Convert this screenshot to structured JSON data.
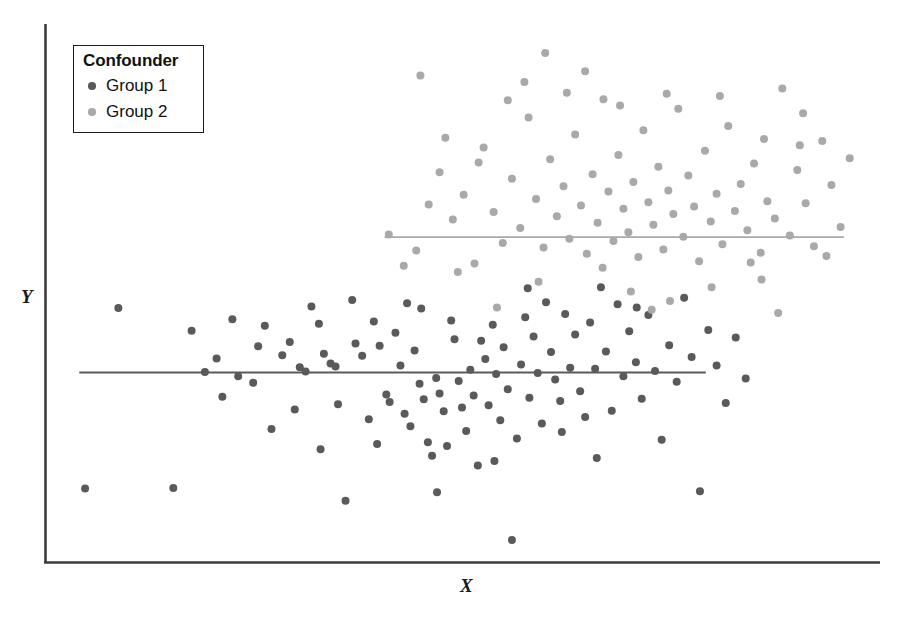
{
  "chart_data": {
    "type": "scatter",
    "title": "",
    "xlabel": "X",
    "ylabel": "Y",
    "grid": false,
    "axis_ticks": false,
    "axis_spines": [
      "left",
      "bottom"
    ],
    "legend": {
      "title": "Confounder",
      "position": "top-left",
      "frame": true,
      "entries": [
        {
          "label": "Group 1",
          "color": "#5a5a5a"
        },
        {
          "label": "Group 2",
          "color": "#a9a9a9"
        }
      ]
    },
    "xlim": [
      0,
      100
    ],
    "ylim": [
      0,
      100
    ],
    "annotation": "Two confounder groups; within each group the regression slope of Y on X is flat, while the pooled data appear positively associated.",
    "series": [
      {
        "name": "Group 1",
        "color": "#5a5a5a",
        "marker": "circle",
        "marker_size": 7,
        "fit_line": {
          "color": "#5a5a5a",
          "x_start": 4.0,
          "x_end": 79.3,
          "y_start": 35.1,
          "y_end": 35.1,
          "slope": 0.0
        },
        "points": [
          [
            4.7,
            13.5
          ],
          [
            15.3,
            13.6
          ],
          [
            8.7,
            47.1
          ],
          [
            17.5,
            42.9
          ],
          [
            20.5,
            37.7
          ],
          [
            22.4,
            45.0
          ],
          [
            23.1,
            34.4
          ],
          [
            24.9,
            33.2
          ],
          [
            26.3,
            43.8
          ],
          [
            27.1,
            24.6
          ],
          [
            28.4,
            38.3
          ],
          [
            29.3,
            40.8
          ],
          [
            30.5,
            36.1
          ],
          [
            31.2,
            35.3
          ],
          [
            31.9,
            47.4
          ],
          [
            32.8,
            44.2
          ],
          [
            33.4,
            38.6
          ],
          [
            34.2,
            36.8
          ],
          [
            34.8,
            36.2
          ],
          [
            35.1,
            29.2
          ],
          [
            36.0,
            11.2
          ],
          [
            37.2,
            40.5
          ],
          [
            38.0,
            38.2
          ],
          [
            38.8,
            26.4
          ],
          [
            39.4,
            44.6
          ],
          [
            40.1,
            40.1
          ],
          [
            40.9,
            31.0
          ],
          [
            41.3,
            29.6
          ],
          [
            42.0,
            42.5
          ],
          [
            42.6,
            36.4
          ],
          [
            43.1,
            27.4
          ],
          [
            43.8,
            25.1
          ],
          [
            44.3,
            39.2
          ],
          [
            44.9,
            33.0
          ],
          [
            45.4,
            30.1
          ],
          [
            45.9,
            22.1
          ],
          [
            46.4,
            19.6
          ],
          [
            46.9,
            34.1
          ],
          [
            47.3,
            31.2
          ],
          [
            47.8,
            27.9
          ],
          [
            48.2,
            21.4
          ],
          [
            48.7,
            44.8
          ],
          [
            49.1,
            41.3
          ],
          [
            49.6,
            33.5
          ],
          [
            50.0,
            28.6
          ],
          [
            50.5,
            24.2
          ],
          [
            51.0,
            35.6
          ],
          [
            51.4,
            30.8
          ],
          [
            51.9,
            17.8
          ],
          [
            52.3,
            41.0
          ],
          [
            52.8,
            37.6
          ],
          [
            53.2,
            29.0
          ],
          [
            53.7,
            44.0
          ],
          [
            54.1,
            34.8
          ],
          [
            54.6,
            26.2
          ],
          [
            55.0,
            39.8
          ],
          [
            55.5,
            32.0
          ],
          [
            56.0,
            3.9
          ],
          [
            56.6,
            22.8
          ],
          [
            57.1,
            36.6
          ],
          [
            57.6,
            45.4
          ],
          [
            58.1,
            30.4
          ],
          [
            58.6,
            41.8
          ],
          [
            59.1,
            35.0
          ],
          [
            59.6,
            25.6
          ],
          [
            60.1,
            48.2
          ],
          [
            60.7,
            38.9
          ],
          [
            61.2,
            33.8
          ],
          [
            61.8,
            29.8
          ],
          [
            62.4,
            46.0
          ],
          [
            63.0,
            36.0
          ],
          [
            63.6,
            42.2
          ],
          [
            64.2,
            31.6
          ],
          [
            64.8,
            26.8
          ],
          [
            65.4,
            44.4
          ],
          [
            66.0,
            35.8
          ],
          [
            66.7,
            51.0
          ],
          [
            67.3,
            39.0
          ],
          [
            68.0,
            28.0
          ],
          [
            68.7,
            47.8
          ],
          [
            69.4,
            34.4
          ],
          [
            70.1,
            42.8
          ],
          [
            70.9,
            37.0
          ],
          [
            71.6,
            30.2
          ],
          [
            72.4,
            45.8
          ],
          [
            73.2,
            35.4
          ],
          [
            74.0,
            22.6
          ],
          [
            74.9,
            40.2
          ],
          [
            75.8,
            33.4
          ],
          [
            76.7,
            49.0
          ],
          [
            77.6,
            38.0
          ],
          [
            78.6,
            13.0
          ],
          [
            79.6,
            43.0
          ],
          [
            80.6,
            36.4
          ],
          [
            81.7,
            29.4
          ],
          [
            82.9,
            41.6
          ],
          [
            84.1,
            34.0
          ],
          [
            36.8,
            48.6
          ],
          [
            29.9,
            28.2
          ],
          [
            33.0,
            20.8
          ],
          [
            25.5,
            40.0
          ],
          [
            21.2,
            30.6
          ],
          [
            19.1,
            35.2
          ],
          [
            43.4,
            48.0
          ],
          [
            47.0,
            12.8
          ],
          [
            53.9,
            18.6
          ],
          [
            57.9,
            50.8
          ],
          [
            62.0,
            24.0
          ],
          [
            66.2,
            19.2
          ],
          [
            71.0,
            47.2
          ],
          [
            45.1,
            47.0
          ],
          [
            39.8,
            21.8
          ]
        ]
      },
      {
        "name": "Group 2",
        "color": "#a9a9a9",
        "marker": "circle",
        "marker_size": 7,
        "fit_line": {
          "color": "#a9a9a9",
          "x_start": 40.7,
          "x_end": 95.9,
          "y_start": 60.3,
          "y_end": 60.3,
          "slope": 0.0
        },
        "points": [
          [
            45.0,
            90.4
          ],
          [
            41.2,
            60.8
          ],
          [
            44.5,
            57.8
          ],
          [
            47.3,
            72.4
          ],
          [
            48.9,
            63.6
          ],
          [
            50.2,
            68.2
          ],
          [
            51.5,
            55.4
          ],
          [
            52.6,
            77.0
          ],
          [
            53.8,
            65.0
          ],
          [
            54.9,
            59.2
          ],
          [
            56.0,
            71.2
          ],
          [
            57.0,
            62.0
          ],
          [
            58.0,
            82.6
          ],
          [
            58.9,
            67.4
          ],
          [
            59.8,
            58.4
          ],
          [
            60.6,
            74.8
          ],
          [
            61.4,
            64.2
          ],
          [
            62.2,
            69.8
          ],
          [
            62.9,
            60.0
          ],
          [
            63.6,
            79.4
          ],
          [
            64.3,
            66.2
          ],
          [
            65.0,
            57.2
          ],
          [
            65.7,
            72.0
          ],
          [
            66.3,
            63.0
          ],
          [
            67.0,
            86.0
          ],
          [
            67.6,
            68.8
          ],
          [
            68.2,
            59.6
          ],
          [
            68.8,
            75.6
          ],
          [
            69.4,
            65.6
          ],
          [
            70.0,
            61.2
          ],
          [
            70.6,
            70.6
          ],
          [
            71.2,
            56.6
          ],
          [
            71.8,
            80.2
          ],
          [
            72.4,
            66.8
          ],
          [
            73.0,
            62.6
          ],
          [
            73.6,
            73.4
          ],
          [
            74.2,
            58.0
          ],
          [
            74.8,
            69.0
          ],
          [
            75.4,
            64.6
          ],
          [
            76.0,
            84.2
          ],
          [
            76.6,
            60.4
          ],
          [
            77.2,
            71.8
          ],
          [
            77.9,
            66.0
          ],
          [
            78.5,
            55.8
          ],
          [
            79.2,
            76.4
          ],
          [
            79.9,
            63.2
          ],
          [
            80.6,
            68.4
          ],
          [
            81.3,
            59.0
          ],
          [
            82.0,
            81.0
          ],
          [
            82.8,
            65.2
          ],
          [
            83.5,
            70.2
          ],
          [
            84.3,
            61.6
          ],
          [
            85.1,
            74.0
          ],
          [
            85.9,
            57.4
          ],
          [
            86.7,
            67.0
          ],
          [
            87.6,
            63.8
          ],
          [
            88.5,
            88.0
          ],
          [
            89.4,
            60.6
          ],
          [
            90.3,
            72.8
          ],
          [
            91.3,
            66.6
          ],
          [
            92.3,
            58.6
          ],
          [
            93.3,
            78.2
          ],
          [
            94.4,
            70.0
          ],
          [
            95.5,
            62.2
          ],
          [
            96.6,
            75.0
          ],
          [
            60.0,
            94.6
          ],
          [
            55.5,
            85.8
          ],
          [
            49.5,
            53.8
          ],
          [
            46.0,
            66.4
          ],
          [
            43.0,
            55.0
          ],
          [
            64.8,
            91.2
          ],
          [
            70.3,
            50.2
          ],
          [
            75.0,
            48.4
          ],
          [
            80.0,
            51.0
          ],
          [
            86.0,
            52.4
          ],
          [
            91.0,
            83.4
          ],
          [
            59.2,
            52.0
          ],
          [
            66.9,
            54.6
          ],
          [
            72.8,
            46.8
          ],
          [
            88.0,
            46.2
          ],
          [
            54.2,
            47.2
          ],
          [
            84.7,
            55.6
          ],
          [
            93.8,
            56.8
          ],
          [
            57.5,
            89.2
          ],
          [
            62.6,
            87.2
          ],
          [
            69.0,
            84.8
          ],
          [
            74.6,
            87.0
          ],
          [
            81.0,
            86.6
          ],
          [
            48.0,
            78.8
          ],
          [
            52.0,
            74.2
          ],
          [
            86.3,
            78.6
          ],
          [
            90.6,
            77.4
          ]
        ]
      }
    ]
  }
}
